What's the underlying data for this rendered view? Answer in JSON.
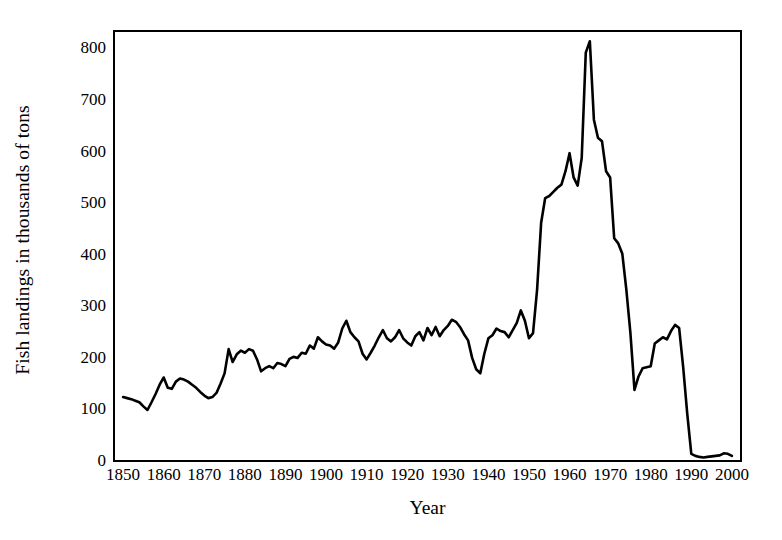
{
  "chart_data": {
    "type": "line",
    "title": "",
    "subtitle": "",
    "xlabel": "Year",
    "ylabel": "Fish landings in thousands of tons",
    "xlim": [
      1848,
      2002
    ],
    "ylim": [
      0,
      830
    ],
    "yticks": [
      0,
      100,
      200,
      300,
      400,
      500,
      600,
      700,
      800
    ],
    "ytick_labels": [
      "0",
      "100",
      "200",
      "300",
      "400",
      "500",
      "600",
      "700",
      "800"
    ],
    "xticks": [
      1850,
      1860,
      1870,
      1880,
      1890,
      1900,
      1910,
      1920,
      1930,
      1940,
      1950,
      1960,
      1970,
      1980,
      1990,
      2000
    ],
    "xtick_labels": [
      "1850",
      "1860",
      "1870",
      "1880",
      "1890",
      "1900",
      "1910",
      "1920",
      "1930",
      "1940",
      "1950",
      "1960",
      "1970",
      "1980",
      "1990",
      "2000"
    ],
    "grid": false,
    "legend": false,
    "legend_position": "none",
    "line_color": "#000000",
    "line_width": 2.6,
    "annotations": [],
    "series": [
      {
        "name": "Fish landings",
        "x": [
          1850,
          1851,
          1852,
          1853,
          1854,
          1855,
          1856,
          1857,
          1858,
          1859,
          1860,
          1861,
          1862,
          1863,
          1864,
          1865,
          1866,
          1867,
          1868,
          1869,
          1870,
          1871,
          1872,
          1873,
          1874,
          1875,
          1876,
          1877,
          1878,
          1879,
          1880,
          1881,
          1882,
          1883,
          1884,
          1885,
          1886,
          1887,
          1888,
          1889,
          1890,
          1891,
          1892,
          1893,
          1894,
          1895,
          1896,
          1897,
          1898,
          1899,
          1900,
          1901,
          1902,
          1903,
          1904,
          1905,
          1906,
          1907,
          1908,
          1909,
          1910,
          1911,
          1912,
          1913,
          1914,
          1915,
          1916,
          1917,
          1918,
          1919,
          1920,
          1921,
          1922,
          1923,
          1924,
          1925,
          1926,
          1927,
          1928,
          1929,
          1930,
          1931,
          1932,
          1933,
          1934,
          1935,
          1936,
          1937,
          1938,
          1939,
          1940,
          1941,
          1942,
          1943,
          1944,
          1945,
          1946,
          1947,
          1948,
          1949,
          1950,
          1951,
          1952,
          1953,
          1954,
          1955,
          1956,
          1957,
          1958,
          1959,
          1960,
          1961,
          1962,
          1963,
          1964,
          1965,
          1966,
          1967,
          1968,
          1969,
          1970,
          1971,
          1972,
          1973,
          1974,
          1975,
          1976,
          1977,
          1978,
          1979,
          1980,
          1981,
          1982,
          1983,
          1984,
          1985,
          1986,
          1987,
          1988,
          1989,
          1990,
          1991,
          1992,
          1993,
          1994,
          1995,
          1996,
          1997,
          1998,
          1999,
          2000
        ],
        "values": [
          122,
          120,
          118,
          115,
          112,
          104,
          97,
          112,
          128,
          146,
          160,
          140,
          138,
          152,
          158,
          156,
          152,
          146,
          140,
          132,
          125,
          120,
          122,
          130,
          148,
          168,
          215,
          190,
          205,
          212,
          208,
          215,
          212,
          195,
          172,
          178,
          182,
          178,
          188,
          186,
          182,
          196,
          200,
          198,
          208,
          206,
          222,
          216,
          238,
          230,
          224,
          222,
          216,
          228,
          255,
          270,
          248,
          238,
          230,
          206,
          195,
          208,
          222,
          238,
          252,
          236,
          230,
          238,
          252,
          236,
          228,
          222,
          240,
          248,
          232,
          256,
          242,
          258,
          240,
          252,
          260,
          272,
          268,
          258,
          244,
          232,
          198,
          176,
          168,
          206,
          236,
          242,
          255,
          250,
          248,
          238,
          252,
          266,
          290,
          270,
          236,
          246,
          330,
          460,
          508,
          512,
          520,
          528,
          534,
          560,
          595,
          548,
          532,
          586,
          790,
          812,
          660,
          625,
          618,
          560,
          548,
          430,
          420,
          400,
          330,
          246,
          136,
          162,
          178,
          180,
          182,
          226,
          232,
          238,
          234,
          250,
          262,
          256,
          180,
          90,
          12,
          8,
          6,
          5,
          6,
          7,
          8,
          9,
          13,
          12,
          8
        ]
      }
    ]
  },
  "axis_title_x": "Year",
  "axis_title_y": "Fish landings in thousands of tons"
}
